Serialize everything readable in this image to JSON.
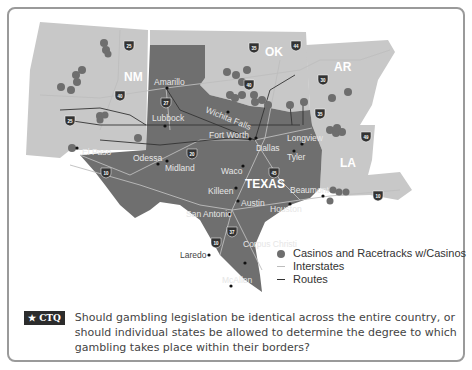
{
  "map": {
    "states": [
      {
        "id": "NM",
        "label": "NM"
      },
      {
        "id": "OK",
        "label": "OK"
      },
      {
        "id": "AR",
        "label": "AR"
      },
      {
        "id": "LA",
        "label": "LA"
      },
      {
        "id": "TX",
        "label": "TEXAS"
      }
    ],
    "cities": [
      {
        "name": "Amarillo"
      },
      {
        "name": "Lubbock"
      },
      {
        "name": "Wichita Falls"
      },
      {
        "name": "Fort Worth"
      },
      {
        "name": "Dallas"
      },
      {
        "name": "Longview"
      },
      {
        "name": "Tyler"
      },
      {
        "name": "El Paso"
      },
      {
        "name": "Odessa"
      },
      {
        "name": "Midland"
      },
      {
        "name": "Waco"
      },
      {
        "name": "Killeen"
      },
      {
        "name": "Austin"
      },
      {
        "name": "Beaumont"
      },
      {
        "name": "Houston"
      },
      {
        "name": "San Antonio"
      },
      {
        "name": "Laredo"
      },
      {
        "name": "Corpus Christi"
      },
      {
        "name": "McAllen"
      }
    ],
    "interstate_shields": [
      "25",
      "40",
      "27",
      "35",
      "44",
      "40",
      "30",
      "20",
      "45",
      "37",
      "35",
      "10",
      "49",
      "10",
      "25",
      "10"
    ]
  },
  "legend": {
    "items": [
      {
        "symbol": "dot",
        "label": "Casinos and Racetracks w/Casinos"
      },
      {
        "symbol": "light-line",
        "label": "Interstates"
      },
      {
        "symbol": "dark-line",
        "label": "Routes"
      }
    ]
  },
  "ctq": {
    "badge": "★ CTQ",
    "question": "Should gambling legislation be identical across the entire country, or should individual states be allowed to determine the degree to which gambling takes place within their borders?"
  },
  "colors": {
    "texas": "#6f6f6f",
    "neighbors": "#c8c8c8",
    "casino_dot": "#6e6e6e",
    "frame": "#9a9a9a"
  }
}
